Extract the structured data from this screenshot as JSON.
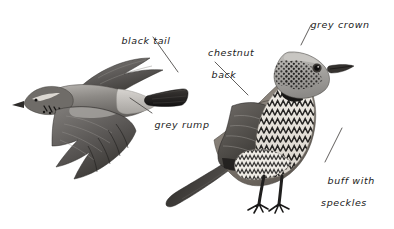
{
  "figure": {
    "background_color": "#ffffff",
    "ink_color": "#1a1a1a",
    "leader_line_color": "#555555"
  },
  "subjects": [
    {
      "name": "flying-bird",
      "pose": "in flight, viewed from the side, facing left, wings swept down"
    },
    {
      "name": "standing-bird",
      "pose": "perched upright on both legs, facing right"
    }
  ],
  "labels": [
    {
      "id": "black-tail",
      "line1": "black tail",
      "line2": "",
      "target": "flying-bird-tail"
    },
    {
      "id": "grey-rump",
      "line1": "grey rump",
      "line2": "",
      "target": "flying-bird-rump"
    },
    {
      "id": "chestnut-back",
      "line1": "chestnut",
      "line2": "back",
      "target": "standing-bird-back"
    },
    {
      "id": "grey-crown",
      "line1": "grey crown",
      "line2": "",
      "target": "standing-bird-crown"
    },
    {
      "id": "buff-speckles",
      "line1": "buff with",
      "line2": "speckles",
      "target": "standing-bird-breast"
    }
  ]
}
